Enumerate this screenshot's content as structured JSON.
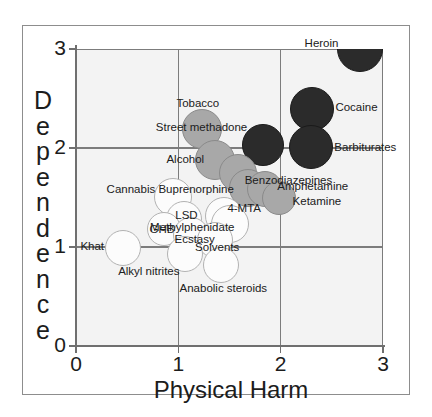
{
  "figure": {
    "x_axis_title": "Physical Harm",
    "y_axis_title_letters": [
      "D",
      "e",
      "p",
      "e",
      "n",
      "d",
      "e",
      "n",
      "c",
      "e"
    ],
    "y_axis_title": "Dependence",
    "x_ticks": [
      "0",
      "1",
      "2",
      "3"
    ],
    "y_ticks": [
      "0",
      "1",
      "2",
      "3"
    ],
    "colors": {
      "class_a": "#2b2b2b",
      "class_b": "#a8a8a8",
      "class_c": "#fcfcfc",
      "panel_background": "#f3f3f3",
      "gridline": "#7c7c7c",
      "frame_border": "#8d8d8d",
      "text": "#1c1c1c"
    }
  },
  "chart_data": {
    "type": "scatter",
    "title": "",
    "subtitle": "",
    "xlabel": "Physical Harm",
    "ylabel": "Dependence",
    "xlim": [
      0,
      3
    ],
    "ylim": [
      0,
      3
    ],
    "xticks": [
      0,
      1,
      2,
      3
    ],
    "yticks": [
      0,
      1,
      2,
      3
    ],
    "grid": true,
    "legend": "none",
    "marker": "bubble",
    "note": "Bubble sizes are roughly uniform; fill shade encodes drug class group (dark = group A, medium gray = group B, white = group C).",
    "points": [
      {
        "label": "Heroin",
        "x": 2.78,
        "y": 3.0,
        "r": 23,
        "group": "class_a",
        "label_anchor": "right",
        "label_dx": -22,
        "label_dy": -6
      },
      {
        "label": "Cocaine",
        "x": 2.31,
        "y": 2.39,
        "r": 22,
        "group": "class_a",
        "label_anchor": "left",
        "label_dx": 23,
        "label_dy": -2
      },
      {
        "label": "Barbiturates",
        "x": 2.3,
        "y": 2.01,
        "r": 22,
        "group": "class_a",
        "label_anchor": "left",
        "label_dx": 23,
        "label_dy": 0
      },
      {
        "label": "Street methadone",
        "x": 1.83,
        "y": 2.03,
        "r": 21,
        "group": "class_a",
        "label_anchor": "right",
        "label_dx": -16,
        "label_dy": -18
      },
      {
        "label": "Tobacco",
        "x": 1.23,
        "y": 2.19,
        "r": 20,
        "group": "class_b",
        "label_anchor": "mid",
        "label_dx": -4,
        "label_dy": -26
      },
      {
        "label": "Alcohol",
        "x": 1.36,
        "y": 1.88,
        "r": 20,
        "group": "class_b",
        "label_anchor": "right",
        "label_dx": -11,
        "label_dy": -1
      },
      {
        "label": "Benzodiazepines",
        "x": 1.58,
        "y": 1.75,
        "r": 19,
        "group": "class_b",
        "label_anchor": "left",
        "label_dx": 7,
        "label_dy": 7
      },
      {
        "label": "Buprenorphine",
        "x": 1.68,
        "y": 1.6,
        "r": 19,
        "group": "class_b",
        "label_anchor": "right",
        "label_dx": -14,
        "label_dy": 1
      },
      {
        "label": "Amphetamine",
        "x": 1.85,
        "y": 1.59,
        "r": 18,
        "group": "class_b",
        "label_anchor": "left",
        "label_dx": 12,
        "label_dy": -3
      },
      {
        "label": "Ketamine",
        "x": 1.98,
        "y": 1.5,
        "r": 17,
        "group": "class_b",
        "label_anchor": "left",
        "label_dx": 14,
        "label_dy": 3
      },
      {
        "label": "Cannabis",
        "x": 0.95,
        "y": 1.51,
        "r": 19,
        "group": "class_c",
        "label_anchor": "right",
        "label_dx": -18,
        "label_dy": -8
      },
      {
        "label": "4-MTA",
        "x": 1.45,
        "y": 1.31,
        "r": 19,
        "group": "class_c",
        "label_anchor": "left",
        "label_dx": 3,
        "label_dy": -8
      },
      {
        "label": "Methylphenidate",
        "x": 1.5,
        "y": 1.23,
        "r": 19,
        "group": "class_c",
        "label_anchor": "right",
        "label_dx": 5,
        "label_dy": 3
      },
      {
        "label": "LSD",
        "x": 1.06,
        "y": 1.28,
        "r": 18,
        "group": "class_c",
        "label_anchor": "mid",
        "label_dx": 2,
        "label_dy": -4
      },
      {
        "label": "GHB",
        "x": 0.86,
        "y": 1.18,
        "r": 17,
        "group": "class_c",
        "label_anchor": "mid",
        "label_dx": -2,
        "label_dy": 0
      },
      {
        "label": "Ecstasy",
        "x": 1.12,
        "y": 1.12,
        "r": 18,
        "group": "class_c",
        "label_anchor": "mid",
        "label_dx": 4,
        "label_dy": 4
      },
      {
        "label": "Khat",
        "x": 0.46,
        "y": 0.99,
        "r": 18,
        "group": "class_c",
        "label_anchor": "right",
        "label_dx": -19,
        "label_dy": -2
      },
      {
        "label": "Solvents",
        "x": 1.36,
        "y": 1.07,
        "r": 18,
        "group": "class_c",
        "label_anchor": "mid",
        "label_dx": 2,
        "label_dy": 7
      },
      {
        "label": "Alkyl nitrites",
        "x": 1.07,
        "y": 0.93,
        "r": 18,
        "group": "class_c",
        "label_anchor": "right",
        "label_dx": -6,
        "label_dy": 17
      },
      {
        "label": "Anabolic steroids",
        "x": 1.42,
        "y": 0.82,
        "r": 18,
        "group": "class_c",
        "label_anchor": "mid",
        "label_dx": 2,
        "label_dy": 23
      }
    ]
  }
}
